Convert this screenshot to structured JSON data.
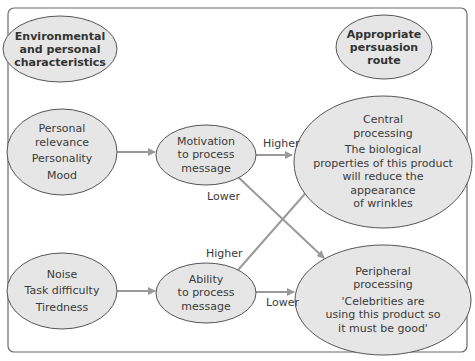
{
  "diagram": {
    "headers": {
      "left": [
        "Environmental",
        "and personal",
        "characteristics"
      ],
      "right": [
        "Appropriate",
        "persuasion",
        "route"
      ]
    },
    "factors": {
      "motivation_factors": [
        "Personal",
        "relevance",
        "Personality",
        "Mood"
      ],
      "ability_factors": [
        "Noise",
        "Task difficulty",
        "Tiredness"
      ]
    },
    "mediators": {
      "motivation": [
        "Motivation",
        "to process",
        "message"
      ],
      "ability": [
        "Ability",
        "to process",
        "message"
      ]
    },
    "routes": {
      "central": {
        "title": [
          "Central",
          "processing"
        ],
        "example": [
          "The biological",
          "properties of this product",
          "will reduce the",
          "appearance",
          "of wrinkles"
        ]
      },
      "peripheral": {
        "title": [
          "Peripheral",
          "processing"
        ],
        "example": [
          "'Celebrities are",
          "using this product so",
          "it must be good'"
        ]
      }
    },
    "edge_labels": {
      "motivation_higher": "Higher",
      "motivation_lower": "Lower",
      "ability_higher": "Higher",
      "ability_lower": "Lower"
    },
    "colors": {
      "node_fill": "#e6e6e6",
      "node_stroke": "#555555",
      "arrow": "#9a9a9a",
      "frame": "#6a6a6a",
      "text": "#3a3a3a"
    }
  }
}
